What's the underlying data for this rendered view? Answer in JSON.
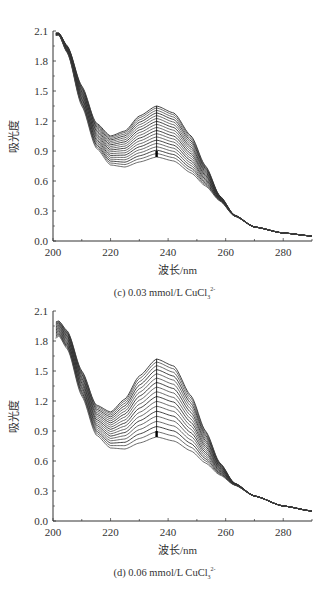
{
  "chart_data": [
    {
      "type": "line",
      "panel": "c",
      "caption": "(c) 0.03 mmol/L CuCl",
      "caption_sub": "3",
      "caption_sup": "2-",
      "xlabel": "波长/nm",
      "ylabel": "吸光度",
      "xlim": [
        200,
        290
      ],
      "ylim": [
        0.0,
        2.1
      ],
      "xticks": [
        200,
        220,
        240,
        260,
        280
      ],
      "yticks": [
        "0.0",
        "0.3",
        "0.6",
        "0.9",
        "1.2",
        "1.5",
        "1.8",
        "2.1"
      ],
      "grid": false,
      "series_count": 18,
      "arrow": {
        "x": 236,
        "from": 1.35,
        "to": 0.84,
        "direction": "down"
      },
      "series_envelope": {
        "x": [
          200,
          202,
          205,
          210,
          215,
          220,
          225,
          230,
          236,
          242,
          248,
          253,
          258,
          263,
          270,
          280,
          290
        ],
        "top": [
          2.08,
          2.08,
          1.95,
          1.55,
          1.18,
          1.05,
          1.1,
          1.25,
          1.35,
          1.28,
          1.05,
          0.75,
          0.45,
          0.26,
          0.14,
          0.08,
          0.05
        ],
        "bottom": [
          2.05,
          2.06,
          1.88,
          1.35,
          0.93,
          0.76,
          0.74,
          0.79,
          0.84,
          0.8,
          0.68,
          0.55,
          0.4,
          0.25,
          0.14,
          0.08,
          0.05
        ]
      }
    },
    {
      "type": "line",
      "panel": "d",
      "caption": "(d) 0.06 mmol/L CuCl",
      "caption_sub": "3",
      "caption_sup": "2-",
      "xlabel": "波长/nm",
      "ylabel": "吸光度",
      "xlim": [
        200,
        290
      ],
      "ylim": [
        0.0,
        2.1
      ],
      "xticks": [
        200,
        220,
        240,
        260,
        280
      ],
      "yticks": [
        "0.0",
        "0.3",
        "0.6",
        "0.9",
        "1.2",
        "1.5",
        "1.8",
        "2.1"
      ],
      "grid": false,
      "series_count": 18,
      "arrow": {
        "x": 236,
        "from": 1.62,
        "to": 0.84,
        "direction": "down"
      },
      "series_envelope": {
        "x": [
          200,
          202,
          205,
          210,
          215,
          220,
          225,
          230,
          236,
          242,
          248,
          253,
          258,
          263,
          270,
          280,
          290
        ],
        "top": [
          1.98,
          2.0,
          1.9,
          1.5,
          1.16,
          1.09,
          1.22,
          1.45,
          1.62,
          1.55,
          1.25,
          0.9,
          0.58,
          0.38,
          0.25,
          0.15,
          0.1
        ],
        "bottom": [
          1.8,
          1.85,
          1.72,
          1.25,
          0.86,
          0.73,
          0.72,
          0.78,
          0.84,
          0.8,
          0.7,
          0.58,
          0.46,
          0.36,
          0.25,
          0.15,
          0.1
        ]
      }
    }
  ]
}
